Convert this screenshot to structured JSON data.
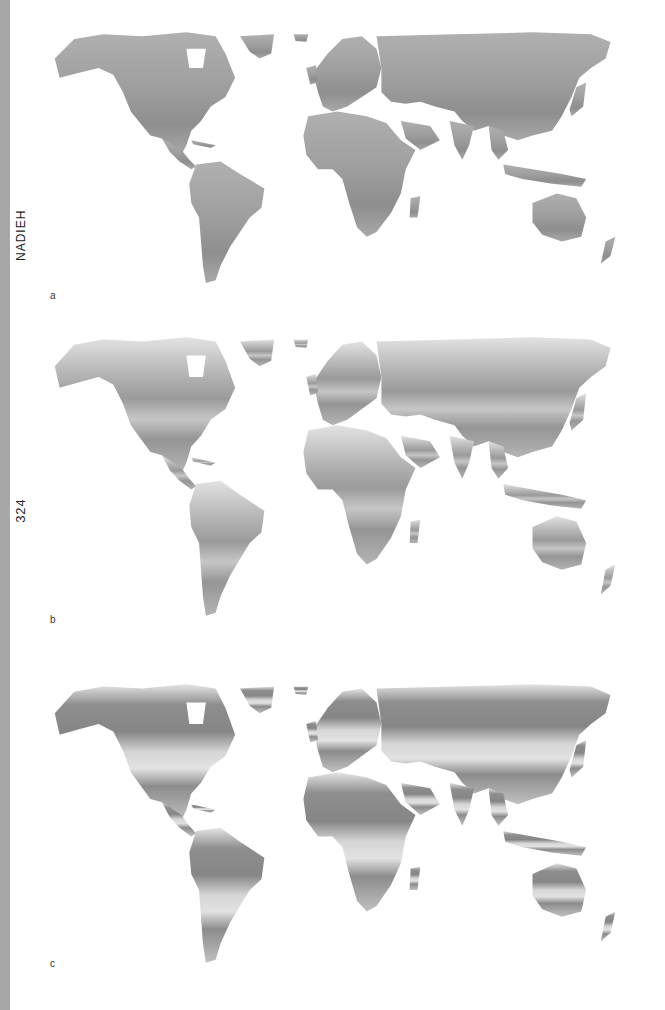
{
  "page": {
    "running_head": "NADIEH",
    "page_number": "324",
    "edge_bar_color": "#a7a7a7"
  },
  "figure": {
    "type": "world-map-series",
    "panels": [
      {
        "label": "a",
        "shading": "uniform mid-gray, darker in tropics",
        "land_color": "#a4a4a4",
        "dark_color": "#8c8c8c",
        "light_color": "#b5b5b5"
      },
      {
        "label": "b",
        "shading": "light at high latitudes and deserts, darker in temperate/tropical zones",
        "land_color": "#a8a8a8",
        "dark_color": "#8e8e8e",
        "light_color": "#dcdcdc"
      },
      {
        "label": "c",
        "shading": "dark across boreal/temperate zones, very light in deserts and Greenland",
        "land_color": "#a0a0a0",
        "dark_color": "#858585",
        "light_color": "#e0e0e0"
      }
    ]
  }
}
